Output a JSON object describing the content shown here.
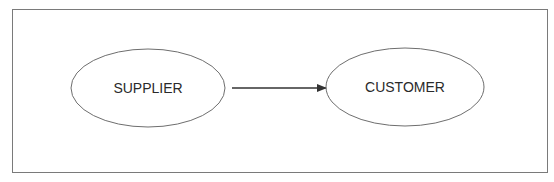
{
  "diagram": {
    "nodes": [
      {
        "id": "supplier",
        "label": "SUPPLIER"
      },
      {
        "id": "customer",
        "label": "CUSTOMER"
      }
    ],
    "edges": [
      {
        "from": "supplier",
        "to": "customer",
        "type": "arrow"
      }
    ],
    "colors": {
      "stroke": "#6e6e6e",
      "arrow": "#333333",
      "text": "#2a2a2a",
      "background": "#ffffff"
    }
  }
}
